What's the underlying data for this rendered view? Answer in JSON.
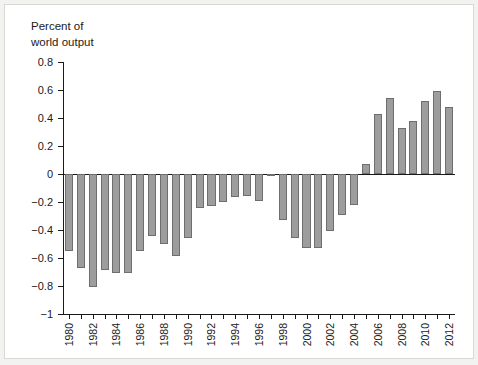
{
  "chart_data": {
    "type": "bar",
    "title": "",
    "ylabel": "Percent of\nworld output",
    "xlabel": "",
    "ylim": [
      -1,
      0.8
    ],
    "yticks": [
      0.8,
      0.6,
      0.4,
      0.2,
      0,
      -0.2,
      -0.4,
      -0.6,
      -0.8,
      -1
    ],
    "ytick_labels": [
      "0.8",
      "0.6",
      "0.4",
      "0.2",
      "0",
      "−0.2",
      "−0.4",
      "−0.6",
      "−0.8",
      "−1"
    ],
    "grid": false,
    "legend": null,
    "categories": [
      "1980",
      "1981",
      "1982",
      "1983",
      "1984",
      "1985",
      "1986",
      "1987",
      "1988",
      "1989",
      "1990",
      "1991",
      "1992",
      "1993",
      "1994",
      "1995",
      "1996",
      "1997",
      "1998",
      "1999",
      "2000",
      "2001",
      "2002",
      "2003",
      "2004",
      "2005",
      "2006",
      "2007",
      "2008",
      "2009",
      "2010",
      "2011",
      "2012"
    ],
    "xtick_labels_shown": [
      "1980",
      "1982",
      "1984",
      "1986",
      "1988",
      "1990",
      "1992",
      "1994",
      "1996",
      "1998",
      "2000",
      "2002",
      "2004",
      "2006",
      "2008",
      "2010",
      "2012"
    ],
    "values": [
      -0.55,
      -0.67,
      -0.81,
      -0.685,
      -0.71,
      -0.71,
      -0.55,
      -0.44,
      -0.5,
      -0.585,
      -0.46,
      -0.24,
      -0.23,
      -0.2,
      -0.165,
      -0.155,
      -0.19,
      -0.01,
      -0.33,
      -0.46,
      -0.53,
      -0.53,
      -0.41,
      -0.29,
      -0.22,
      0.075,
      0.43,
      0.545,
      0.33,
      0.38,
      0.525,
      0.595,
      0.48
    ],
    "bar_color": "#9d9d9d",
    "bar_edge_color": "#6e6e6e",
    "axis_color": "#1a1a1a",
    "background_color": "#ffffff",
    "frame_color": "#f2f2f0"
  }
}
